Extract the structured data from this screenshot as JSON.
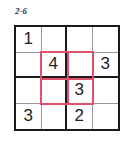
{
  "puzzle": {
    "label": "2-6",
    "size": 4,
    "cells": [
      [
        "1",
        "",
        "",
        ""
      ],
      [
        "",
        "4",
        "",
        "3"
      ],
      [
        "",
        "",
        "3",
        ""
      ],
      [
        "3",
        "",
        "2",
        ""
      ]
    ],
    "highlight_color": "#e0506a",
    "highlight_region": {
      "rows": [
        1,
        2
      ],
      "cols": [
        1,
        2
      ]
    }
  }
}
